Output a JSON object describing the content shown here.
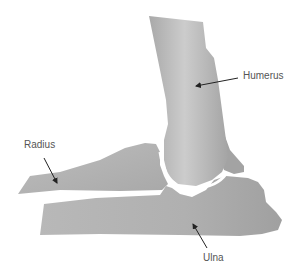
{
  "diagram": {
    "labels": {
      "humerus": "Humerus",
      "radius": "Radius",
      "ulna": "Ulna"
    },
    "colors": {
      "bone": "#b3b3b3",
      "bone_light": "#cfcfcf",
      "bone_dark": "#9a9a9a",
      "label_text": "#555555",
      "arrow": "#222222",
      "background": "#ffffff"
    }
  }
}
